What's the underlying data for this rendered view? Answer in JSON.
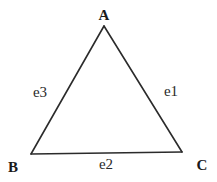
{
  "diagram": {
    "type": "triangle-graph",
    "vertices": [
      {
        "id": "A",
        "label": "A",
        "x": 104,
        "y": 26,
        "label_x": 104,
        "label_y": 20
      },
      {
        "id": "B",
        "label": "B",
        "x": 31,
        "y": 154,
        "label_x": 13,
        "label_y": 172
      },
      {
        "id": "C",
        "label": "C",
        "x": 182,
        "y": 152,
        "label_x": 202,
        "label_y": 170
      }
    ],
    "edges": [
      {
        "id": "e1",
        "label": "e1",
        "from": "A",
        "to": "C",
        "label_x": 171,
        "label_y": 96
      },
      {
        "id": "e2",
        "label": "e2",
        "from": "B",
        "to": "C",
        "label_x": 106,
        "label_y": 169
      },
      {
        "id": "e3",
        "label": "e3",
        "from": "A",
        "to": "B",
        "label_x": 40,
        "label_y": 97
      }
    ],
    "colors": {
      "stroke": "#2b2b2b",
      "text": "#1a1a1a",
      "background": "#ffffff"
    }
  }
}
